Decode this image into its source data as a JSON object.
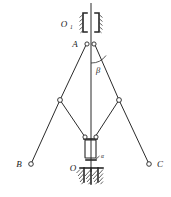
{
  "figure": {
    "type": "mechanical-linkage-kinematic-diagram",
    "background_color": "#ffffff",
    "line_color": "#2b2b2b"
  },
  "labels": {
    "o1": "O",
    "o1_subscript": "1",
    "a": "A",
    "beta": "β",
    "alpha": "α",
    "b": "B",
    "c": "C",
    "o": "O"
  },
  "geometry": {
    "rod_top": {
      "x": 91,
      "y": 3
    },
    "rod_bottom": {
      "x": 91,
      "y": 168
    },
    "joint_a_left": {
      "x": 87,
      "y": 44
    },
    "joint_a_right": {
      "x": 94,
      "y": 44
    },
    "mid_joint_left": {
      "x": 60,
      "y": 100
    },
    "mid_joint_right": {
      "x": 119,
      "y": 100
    },
    "lower_joint_left": {
      "x": 85,
      "y": 138
    },
    "lower_joint_right": {
      "x": 95,
      "y": 138
    },
    "end_joint_b": {
      "x": 31,
      "y": 164
    },
    "end_joint_c": {
      "x": 149,
      "y": 164
    },
    "upper_support_y": 22,
    "lower_support_y": 170,
    "collar": {
      "x": 84,
      "y": 140,
      "width": 13,
      "height": 20
    }
  },
  "annotations": {
    "beta_angle_vertex": {
      "x": 91,
      "y": 45
    },
    "beta_arc_radius": 17,
    "alpha_marker": {
      "x": 99,
      "y": 158
    }
  },
  "joints": [
    {
      "name": "A-left",
      "cx": 87,
      "cy": 44,
      "r": 2.1
    },
    {
      "name": "A-right",
      "cx": 94,
      "cy": 44,
      "r": 2.1
    },
    {
      "name": "mid-left",
      "cx": 60,
      "cy": 100,
      "r": 2.4
    },
    {
      "name": "mid-right",
      "cx": 119,
      "cy": 100,
      "r": 2.4
    },
    {
      "name": "lower-left",
      "cx": 85,
      "cy": 138,
      "r": 2.1
    },
    {
      "name": "lower-right",
      "cx": 95,
      "cy": 138,
      "r": 2.1
    },
    {
      "name": "end-B",
      "cx": 31,
      "cy": 164,
      "r": 2.3
    },
    {
      "name": "end-C",
      "cx": 149,
      "cy": 164,
      "r": 2.3
    }
  ]
}
